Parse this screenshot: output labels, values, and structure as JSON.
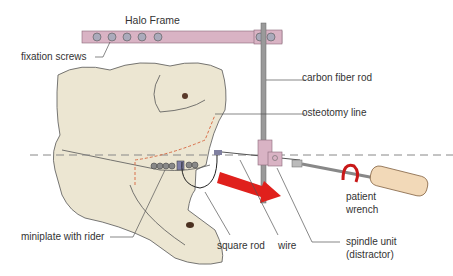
{
  "title": "Halo Frame",
  "labels": {
    "fixation_screws": "fixation screws",
    "carbon_fiber_rod": "carbon fiber rod",
    "osteotomy_line": "osteotomy line",
    "patient_wrench_1": "patient",
    "patient_wrench_2": "wrench",
    "miniplate": "miniplate with rider",
    "square_rod": "square rod",
    "wire": "wire",
    "spindle_1": "spindle unit",
    "spindle_2": "(distractor)"
  },
  "colors": {
    "bone": "#ece6d2",
    "frame": "#d9b3c4",
    "arrow": "#e0201c",
    "osteotomy": "#d9704a",
    "rod": "#9a9a9a"
  }
}
